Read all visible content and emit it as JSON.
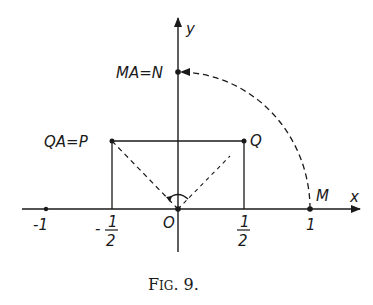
{
  "figure": {
    "caption": {
      "prefix": "F",
      "smallcaps": "IG",
      "suffix": ". 9."
    },
    "axes": {
      "x_label": "x",
      "y_label": "y",
      "origin_label": "O"
    },
    "points": {
      "M": {
        "label": "M",
        "coords": [
          1,
          0
        ]
      },
      "N": {
        "label": "MA=N",
        "coords": [
          0,
          1
        ]
      },
      "P": {
        "label": "QA=P",
        "coords": [
          -0.5,
          0.5
        ]
      },
      "Q": {
        "label": "Q",
        "coords": [
          0.5,
          0.5
        ]
      },
      "neg_one": {
        "label": "-1",
        "coords": [
          -1,
          0
        ]
      }
    },
    "ticks": {
      "neg_one": "-1",
      "neg_half_sign": "-",
      "half_num": "1",
      "half_den": "2",
      "one": "1"
    },
    "colors": {
      "ink": "#1a1a1a",
      "paper": "#ffffff"
    }
  }
}
